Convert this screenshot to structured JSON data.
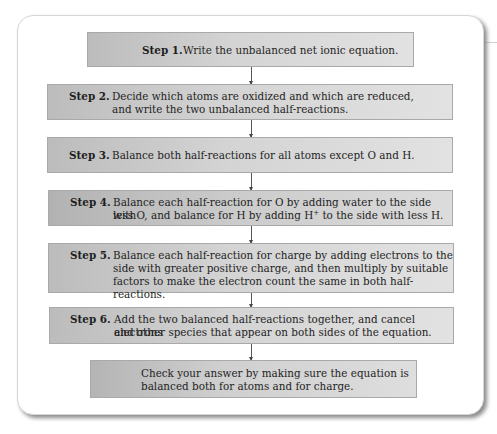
{
  "flowchart": {
    "steps": [
      {
        "label": "Step 1.",
        "text": "Write the unbalanced net ionic equation."
      },
      {
        "label": "Step 2.",
        "line1": "Decide which atoms are oxidized and which are reduced,",
        "line2": "and write the two unbalanced half-reactions."
      },
      {
        "label": "Step 3.",
        "text": "Balance both half-reactions for all atoms except O and H."
      },
      {
        "label": "Step 4.",
        "line1": "Balance each half-reaction for O by adding water to the side with",
        "line2_pre": "less O, and balance for H by adding H",
        "line2_sup": "+",
        "line2_post": " to the side with less H."
      },
      {
        "label": "Step 5.",
        "line1": "Balance each half-reaction for charge by adding electrons to the",
        "line2": "side with greater positive charge, and then multiply by suitable",
        "line3": "factors to make the electron count the same in both half-reactions."
      },
      {
        "label": "Step 6.",
        "line1": "Add the two balanced half-reactions together, and cancel electrons",
        "line2": "and other species that appear on both sides of the equation."
      }
    ],
    "final": {
      "line1": "Check your answer by making sure the equation is",
      "line2": "balanced both for atoms and for charge."
    }
  },
  "colors": {
    "box_dark": "#bcbcbc",
    "box_light": "#e2e2e2",
    "border": "#a9a9a9"
  }
}
